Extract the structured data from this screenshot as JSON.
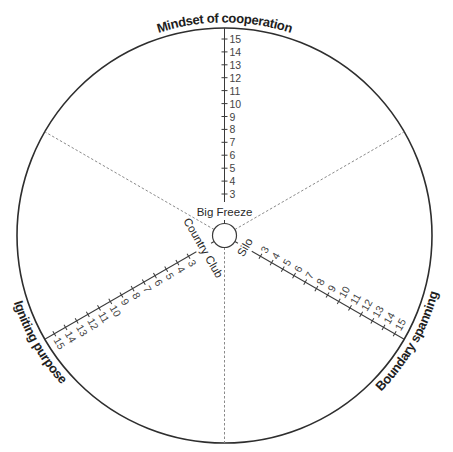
{
  "diagram": {
    "colors": {
      "stroke": "#2e2e2e",
      "dashed": "#8a8a8a",
      "text": "#444444"
    },
    "axes": [
      {
        "name": "Mindset of cooperation",
        "inner_label": "Big Freeze",
        "ticks": [
          "3",
          "4",
          "5",
          "6",
          "7",
          "8",
          "9",
          "10",
          "11",
          "12",
          "13",
          "14",
          "15"
        ]
      },
      {
        "name": "Boundary spanning",
        "inner_label": "Silo",
        "ticks": [
          "3",
          "4",
          "5",
          "6",
          "7",
          "8",
          "9",
          "10",
          "11",
          "12",
          "13",
          "14",
          "15"
        ]
      },
      {
        "name": "Igniting purpose",
        "inner_label": "Country Club",
        "ticks": [
          "3",
          "4",
          "5",
          "6",
          "7",
          "8",
          "9",
          "10",
          "11",
          "12",
          "13",
          "14",
          "15"
        ]
      }
    ],
    "scale": {
      "min": 3,
      "max": 15,
      "step": 1
    }
  }
}
